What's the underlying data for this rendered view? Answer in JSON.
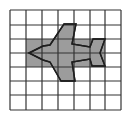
{
  "figure": {
    "grid": {
      "columns": 7,
      "rows": 7,
      "x_lines": [
        10,
        26,
        42,
        58,
        74,
        90,
        105,
        121
      ],
      "y_lines": [
        10,
        25,
        39,
        53,
        67,
        81,
        95,
        110
      ],
      "line_color": "#333333"
    },
    "shaded_rectangle": {
      "x": 26,
      "y": 39,
      "width": 79,
      "height": 28,
      "fill": "#9c9c9c"
    },
    "airplane": {
      "points": "29,53 43,46 50,45 64,24 76,24 72,44 90,47 93,39 105,39 100,53 105,66 92,66 90,59 72,62 75,81 61,81 50,62 43,60",
      "fill": "#9c9c9c",
      "stroke": "#1e1e1e"
    }
  }
}
